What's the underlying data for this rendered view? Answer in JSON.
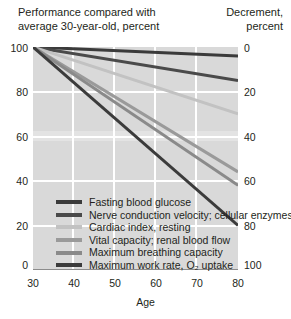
{
  "header": {
    "left_title": "Performance compared with average 30-year-old, percent",
    "right_title": "Decrement, percent"
  },
  "axes": {
    "x_label": "Age",
    "x_ticks": [
      "30",
      "40",
      "50",
      "60",
      "70",
      "80"
    ],
    "y_left_ticks": [
      "100",
      "80",
      "60",
      "40",
      "20",
      "0"
    ],
    "y_right_ticks": [
      "0",
      "20",
      "40",
      "60",
      "80",
      "100"
    ]
  },
  "legend": [
    {
      "label": "Fasting blood glucose",
      "color": "#3b3b3b"
    },
    {
      "label": "Nerve conduction velocity; cellular enzymes",
      "color": "#4a4a4a"
    },
    {
      "label": "Cardiac index, resting",
      "color": "#c2c2c2"
    },
    {
      "label": "Vital capacity; renal blood flow",
      "color": "#9a9a9a"
    },
    {
      "label": "Maximum breathing capacity",
      "color": "#8a8a8a"
    },
    {
      "label": "Maximum work rate, O₂ uptake",
      "color": "#3b3b3b"
    }
  ],
  "chart_data": {
    "type": "line",
    "title": "Performance compared with average 30-year-old, percent",
    "xlabel": "Age",
    "ylabel": "Performance compared with average 30-year-old, percent",
    "y2label": "Decrement, percent",
    "xlim": [
      30,
      80
    ],
    "ylim": [
      0,
      100
    ],
    "y2lim": [
      100,
      0
    ],
    "grid": true,
    "legend_position": "inside-bottom-left",
    "x": [
      30,
      80
    ],
    "series": [
      {
        "name": "Fasting blood glucose",
        "values": [
          100,
          96
        ],
        "color": "#3b3b3b",
        "decrement_at_80": 4
      },
      {
        "name": "Nerve conduction velocity; cellular enzymes",
        "values": [
          100,
          85
        ],
        "color": "#4a4a4a",
        "decrement_at_80": 15
      },
      {
        "name": "Cardiac index, resting",
        "values": [
          100,
          70
        ],
        "color": "#c2c2c2",
        "decrement_at_80": 30
      },
      {
        "name": "Vital capacity; renal blood flow",
        "values": [
          100,
          44
        ],
        "color": "#9a9a9a",
        "decrement_at_80": 56
      },
      {
        "name": "Maximum breathing capacity",
        "values": [
          100,
          38
        ],
        "color": "#8a8a8a",
        "decrement_at_80": 62
      },
      {
        "name": "Maximum work rate, O₂ uptake",
        "values": [
          100,
          20
        ],
        "color": "#3b3b3b",
        "decrement_at_80": 80
      }
    ]
  }
}
